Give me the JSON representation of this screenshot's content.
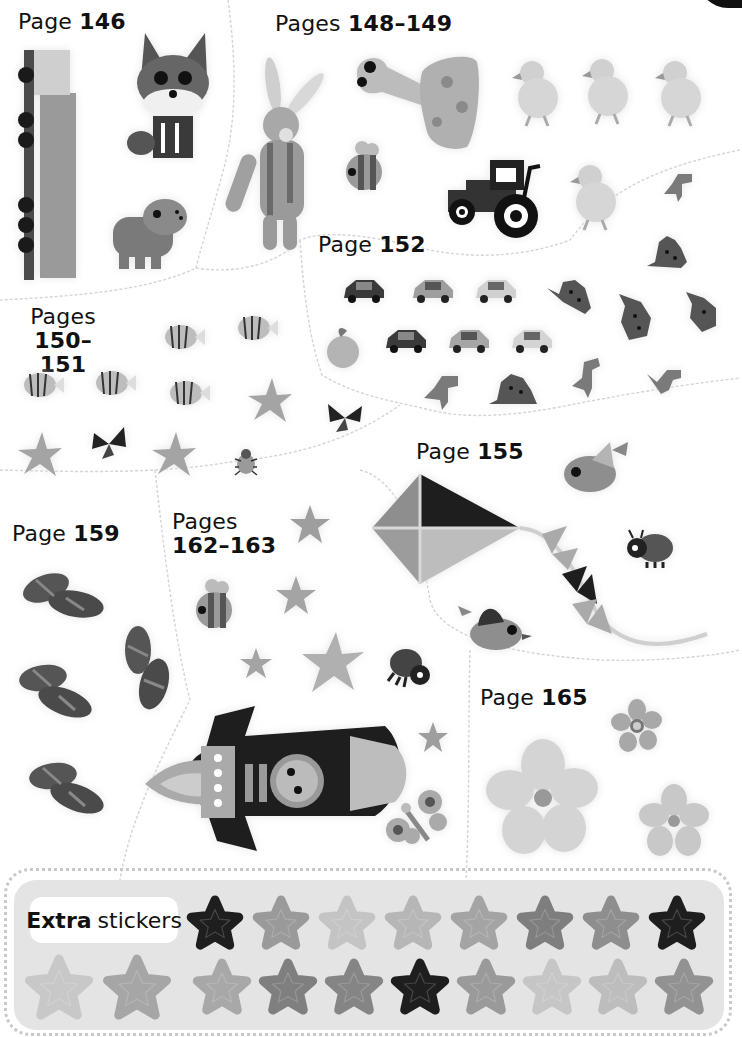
{
  "page_corner": {
    "color": "#111111"
  },
  "sections": [
    {
      "id": "p146",
      "prefix": "Page",
      "pages": "146",
      "stickers": [
        "train",
        "fox",
        "hippo"
      ]
    },
    {
      "id": "p148",
      "prefix": "Pages",
      "pages": "148–149",
      "stickers": [
        "knitted-bunny",
        "mushroom-snail",
        "duckling",
        "duckling",
        "duckling",
        "bee",
        "tractor",
        "duckling"
      ]
    },
    {
      "id": "p150",
      "prefix": "Pages",
      "pages": "150–151",
      "stickers": [
        "fish",
        "fish",
        "fish",
        "fish",
        "fish",
        "starfish",
        "starfish",
        "butterfly",
        "starfish",
        "beetle",
        "butterfly"
      ]
    },
    {
      "id": "p152",
      "prefix": "Page",
      "pages": "152",
      "stickers": [
        "car-dark",
        "car-silver",
        "car-white",
        "apple",
        "car-dark",
        "car-silver",
        "car-white",
        "t-rex",
        "stegosaurus",
        "stegosaurus",
        "stegosaurus",
        "stegosaurus",
        "t-rex",
        "stegosaurus",
        "t-rex",
        "t-rex"
      ]
    },
    {
      "id": "p155",
      "prefix": "Page",
      "pages": "155",
      "stickers": [
        "kite",
        "bird",
        "ladybird",
        "bird"
      ]
    },
    {
      "id": "p159",
      "prefix": "Page",
      "pages": "159",
      "stickers": [
        "sandals",
        "sandals",
        "sandals",
        "sandals"
      ]
    },
    {
      "id": "p162",
      "prefix": "Pages",
      "pages": "162–163",
      "stickers": [
        "glitter-star",
        "bee",
        "glitter-star",
        "glitter-star",
        "glitter-star",
        "ladybird",
        "rocket",
        "glitter-star",
        "butterfly"
      ]
    },
    {
      "id": "p165",
      "prefix": "Page",
      "pages": "165",
      "stickers": [
        "flower-large",
        "flower-small",
        "flower-medium"
      ]
    }
  ],
  "extra": {
    "label_bold": "Extra",
    "label_rest": "stickers",
    "row1_colors": [
      "#1e1e1e",
      "#9a9a9a",
      "#c4c4c4",
      "#b6b6b6",
      "#a4a4a4",
      "#7e7e7e",
      "#8e8e8e",
      "#1e1e1e"
    ],
    "row2_colors": [
      "#c8c8c8",
      "#a6a6a6",
      "#a8a8a8",
      "#7f7f7f",
      "#858585",
      "#1e1e1e",
      "#9a9a9a",
      "#c6c6c6",
      "#bdbdbd",
      "#929292"
    ]
  }
}
